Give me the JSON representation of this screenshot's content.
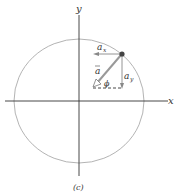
{
  "diagram": {
    "caption": "(c)",
    "axes": {
      "x_label": "x",
      "y_label": "y"
    },
    "vector_labels": {
      "a": "a",
      "ax": "a",
      "ax_sub": "x",
      "ay": "a",
      "ay_sub": "y",
      "angle": "ϕ"
    },
    "colors": {
      "circle": "#aaaaaa",
      "axis": "#333333",
      "vector": "#888888",
      "particle": "#333333"
    }
  }
}
